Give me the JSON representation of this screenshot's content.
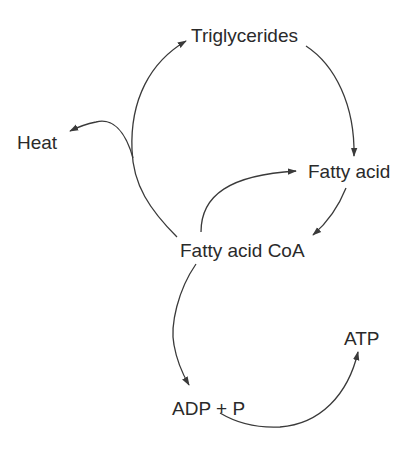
{
  "diagram": {
    "title": "",
    "colors": {
      "line": "#3a3a3a",
      "text": "#2a2a2a",
      "background": "#ffffff"
    },
    "nodes": {
      "triglycerides": "Triglycerides",
      "heat": "Heat",
      "fatty_acid": "Fatty acid",
      "fatty_acid_coa": "Fatty acid CoA",
      "atp": "ATP",
      "adp_p": "ADP + P"
    },
    "edges": [
      {
        "from": "Fatty acid CoA",
        "to": "Triglycerides"
      },
      {
        "from": "Fatty acid CoA",
        "to": "Heat"
      },
      {
        "from": "Triglycerides",
        "to": "Fatty acid"
      },
      {
        "from": "Fatty acid",
        "to": "Fatty acid CoA"
      },
      {
        "from": "Fatty acid CoA",
        "to": "Fatty acid"
      },
      {
        "from": "Fatty acid CoA",
        "to": "ADP + P"
      },
      {
        "from": "ADP + P",
        "to": "ATP"
      }
    ]
  }
}
